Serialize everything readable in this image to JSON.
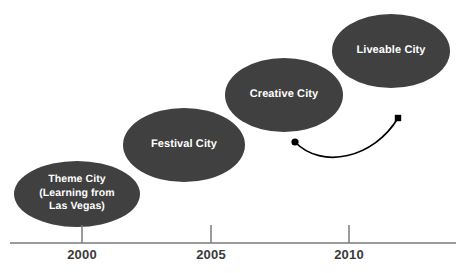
{
  "figure": {
    "type": "timeline-diagram",
    "background_color": "#ffffff",
    "node_fill_color": "#404040",
    "node_text_color": "#ffffff",
    "axis_color": "#7a7a7a",
    "connector_color": "#000000"
  },
  "nodes": [
    {
      "id": "theme-city",
      "lines": [
        "Theme City",
        "(Learning from",
        "Las Vegas)"
      ],
      "cx": 77,
      "cy": 194,
      "rx": 63,
      "ry": 33,
      "font_size": 10.5
    },
    {
      "id": "festival-city",
      "lines": [
        "Festival City"
      ],
      "cx": 184,
      "cy": 145,
      "rx": 61,
      "ry": 37,
      "font_size": 11
    },
    {
      "id": "creative-city",
      "lines": [
        "Creative City"
      ],
      "cx": 284,
      "cy": 95,
      "rx": 59,
      "ry": 37,
      "font_size": 11
    },
    {
      "id": "liveable-city",
      "lines": [
        "Liveable City"
      ],
      "cx": 391,
      "cy": 51,
      "rx": 59,
      "ry": 37,
      "font_size": 11
    }
  ],
  "axis": {
    "label": "",
    "line": {
      "x1": 10,
      "x2": 456,
      "y": 243
    },
    "ticks": [
      {
        "label": "2000",
        "x": 82
      },
      {
        "label": "2005",
        "x": 211
      },
      {
        "label": "2010",
        "x": 349
      }
    ],
    "tick_top_y": 225,
    "tick_label_y": 247
  },
  "connector": {
    "id": "curved-connector",
    "start": {
      "x": 295,
      "y": 142,
      "marker": "circle"
    },
    "end": {
      "x": 398,
      "y": 118,
      "marker": "square"
    },
    "control1": {
      "x": 322,
      "y": 170
    },
    "control2": {
      "x": 374,
      "y": 158
    }
  },
  "chart_data": {
    "type": "timeline",
    "title": "",
    "xlabel": "",
    "ylabel": "",
    "xlim": [
      1997,
      2013
    ],
    "x_ticks": [
      2000,
      2005,
      2010
    ],
    "grid": false,
    "legend": "none",
    "stages": [
      {
        "label": "Theme City (Learning from Las Vegas)",
        "year": 2000,
        "stage_index": 1
      },
      {
        "label": "Festival City",
        "year": 2004,
        "stage_index": 2
      },
      {
        "label": "Creative City",
        "year": 2008,
        "stage_index": 3
      },
      {
        "label": "Liveable City",
        "year": 2012,
        "stage_index": 4
      }
    ],
    "annotations": [
      {
        "type": "curved-arrow",
        "from_year": 2008,
        "to_year": 2012,
        "text": ""
      }
    ]
  }
}
